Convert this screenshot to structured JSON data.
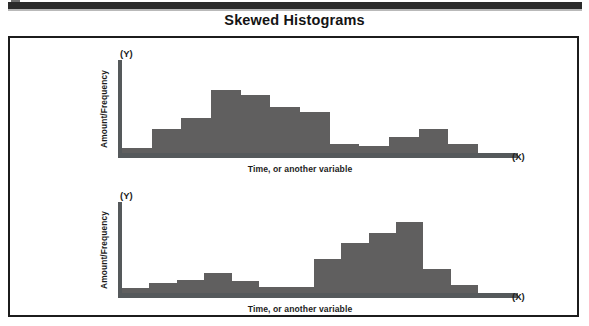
{
  "figure": {
    "title": "Skewed Histograms"
  },
  "chart_data": [
    {
      "type": "bar",
      "name": "right-skewed-histogram",
      "title": "Skewed Histograms",
      "xlabel": "Time, or another variable",
      "ylabel": "Amount/Frequency",
      "x_axis_marker": "(X)",
      "y_axis_marker": "(Y)",
      "grid": false,
      "legend": "none",
      "bar_color": "#605f5f",
      "axis_color": "#55595b",
      "ylim": [
        0,
        100
      ],
      "categories": [
        "1",
        "2",
        "3",
        "4",
        "5",
        "6",
        "7",
        "8",
        "9",
        "10",
        "11",
        "12"
      ],
      "values": [
        5,
        26,
        38,
        68,
        62,
        50,
        44,
        10,
        8,
        17,
        26,
        10
      ]
    },
    {
      "type": "bar",
      "name": "left-skewed-histogram",
      "title": "Skewed Histograms",
      "xlabel": "Time, or another variable",
      "ylabel": "Amount/Frequency",
      "x_axis_marker": "(X)",
      "y_axis_marker": "(Y)",
      "grid": false,
      "legend": "none",
      "bar_color": "#605f5f",
      "axis_color": "#55595b",
      "ylim": [
        0,
        100
      ],
      "categories": [
        "1",
        "2",
        "3",
        "4",
        "5",
        "6",
        "7",
        "8",
        "9",
        "10",
        "11",
        "12"
      ],
      "values": [
        6,
        11,
        14,
        22,
        13,
        7,
        7,
        37,
        55,
        66,
        78,
        26,
        9
      ]
    }
  ]
}
